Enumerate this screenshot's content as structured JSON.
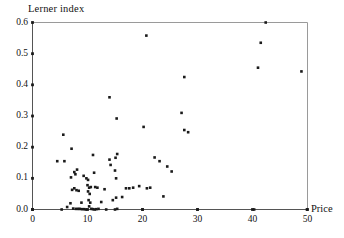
{
  "chart_data": {
    "type": "scatter",
    "title": "",
    "subtitle": "",
    "xlabel": "Price",
    "ylabel": "Lerner index",
    "xlim": [
      0,
      50
    ],
    "ylim": [
      0.0,
      0.6
    ],
    "grid": false,
    "legend": null,
    "xticks": [
      0,
      10,
      20,
      30,
      40,
      50
    ],
    "xtick_labels": [
      "0",
      "10",
      "20",
      "30",
      "40",
      "50"
    ],
    "yticks": [
      0.0,
      0.1,
      0.2,
      0.3,
      0.4,
      0.5,
      0.6
    ],
    "ytick_labels": [
      "0.0",
      "0.1",
      "0.2",
      "0.3",
      "0.4",
      "0.5",
      "0.6"
    ],
    "marker": "filled-square-dot",
    "marker_color": "#1a1a1a",
    "marker_size": 2.6,
    "axis_color": "#555555",
    "background_color": "#ffffff",
    "points": [
      [
        4.5,
        0.155
      ],
      [
        5.6,
        0.24
      ],
      [
        5.8,
        0.155
      ],
      [
        5.3,
        0.0
      ],
      [
        6.3,
        0.008
      ],
      [
        7.1,
        0.195
      ],
      [
        7.0,
        0.103
      ],
      [
        7.6,
        0.12
      ],
      [
        7.8,
        0.113
      ],
      [
        7.2,
        0.063
      ],
      [
        7.6,
        0.068
      ],
      [
        8.0,
        0.062
      ],
      [
        8.4,
        0.06
      ],
      [
        6.9,
        0.02
      ],
      [
        7.4,
        0.003
      ],
      [
        7.9,
        0.002
      ],
      [
        8.3,
        0.002
      ],
      [
        8.6,
        0.002
      ],
      [
        8.9,
        0.022
      ],
      [
        9.0,
        0.001
      ],
      [
        9.4,
        0.001
      ],
      [
        9.7,
        0.0
      ],
      [
        8.1,
        0.128
      ],
      [
        9.3,
        0.108
      ],
      [
        9.8,
        0.1
      ],
      [
        10.1,
        0.095
      ],
      [
        10.0,
        0.078
      ],
      [
        10.3,
        0.07
      ],
      [
        10.6,
        0.072
      ],
      [
        10.1,
        0.058
      ],
      [
        10.4,
        0.05
      ],
      [
        10.2,
        0.03
      ],
      [
        10.5,
        0.022
      ],
      [
        10.3,
        0.01
      ],
      [
        10.7,
        0.002
      ],
      [
        11.0,
        0.001
      ],
      [
        11.3,
        0.0
      ],
      [
        11.6,
        0.001
      ],
      [
        11.0,
        0.175
      ],
      [
        11.2,
        0.118
      ],
      [
        11.4,
        0.072
      ],
      [
        11.8,
        0.07
      ],
      [
        12.0,
        0.002
      ],
      [
        12.5,
        0.024
      ],
      [
        13.1,
        0.065
      ],
      [
        13.4,
        0.0
      ],
      [
        14.0,
        0.36
      ],
      [
        14.2,
        0.143
      ],
      [
        14.0,
        0.16
      ],
      [
        14.6,
        0.03
      ],
      [
        15.3,
        0.292
      ],
      [
        15.4,
        0.178
      ],
      [
        15.1,
        0.166
      ],
      [
        15.0,
        0.125
      ],
      [
        15.2,
        0.1
      ],
      [
        15.2,
        0.038
      ],
      [
        15.0,
        0.0
      ],
      [
        15.4,
        0.002
      ],
      [
        16.3,
        0.04
      ],
      [
        17.0,
        0.068
      ],
      [
        17.6,
        0.068
      ],
      [
        18.3,
        0.07
      ],
      [
        19.4,
        0.075
      ],
      [
        20.0,
        0.0
      ],
      [
        20.2,
        0.265
      ],
      [
        20.7,
        0.558
      ],
      [
        20.8,
        0.068
      ],
      [
        21.4,
        0.07
      ],
      [
        22.2,
        0.167
      ],
      [
        23.1,
        0.155
      ],
      [
        23.8,
        0.042
      ],
      [
        24.5,
        0.138
      ],
      [
        25.3,
        0.122
      ],
      [
        27.1,
        0.31
      ],
      [
        27.6,
        0.425
      ],
      [
        27.6,
        0.255
      ],
      [
        28.3,
        0.248
      ],
      [
        30.0,
        0.0
      ],
      [
        40.3,
        0.0
      ],
      [
        41.0,
        0.455
      ],
      [
        41.5,
        0.535
      ],
      [
        42.4,
        0.6
      ],
      [
        48.9,
        0.443
      ],
      [
        49.9,
        0.0
      ]
    ]
  }
}
